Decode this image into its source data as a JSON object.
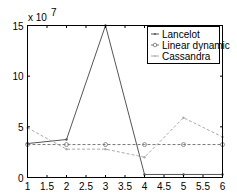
{
  "chart_data": {
    "type": "line",
    "title": "",
    "xlabel": "",
    "ylabel": "",
    "y_exponent_label": "x 10^7",
    "y_exponent_base": "x 10",
    "y_exponent_power": "7",
    "xlim": [
      1,
      6
    ],
    "ylim": [
      0,
      15
    ],
    "grid": false,
    "legend_position": "upper right (inside)",
    "x_ticks": [
      1,
      1.5,
      2,
      2.5,
      3,
      3.5,
      4,
      4.5,
      5,
      5.5,
      6
    ],
    "x_tick_labels": [
      "1",
      "1.5",
      "2",
      "2.5",
      "3",
      "3.5",
      "4",
      "4.5",
      "5",
      "5.5",
      "6"
    ],
    "y_ticks": [
      0,
      5,
      10,
      15
    ],
    "y_tick_labels": [
      "0",
      "5",
      "10",
      "15"
    ],
    "x": [
      1,
      2,
      3,
      4,
      5,
      6
    ],
    "series": [
      {
        "name": "Lancelot",
        "style": "solid",
        "marker": "dot",
        "color": "#555555",
        "values": [
          3.35,
          3.75,
          15.0,
          0.3,
          0.3,
          0.3
        ]
      },
      {
        "name": "Linear dynamic",
        "style": "dashed",
        "marker": "circle",
        "color": "#777777",
        "values": [
          3.25,
          3.25,
          3.25,
          3.25,
          3.25,
          3.25
        ]
      },
      {
        "name": "Cassandra",
        "style": "dashed",
        "marker": "dot",
        "color": "#aaaaaa",
        "values": [
          4.9,
          2.8,
          2.8,
          2.0,
          5.9,
          4.0
        ]
      }
    ]
  }
}
